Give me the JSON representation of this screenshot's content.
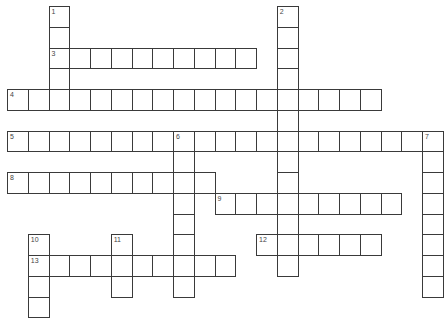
{
  "puzzle": {
    "type": "crossword",
    "grid": {
      "origin_x": 7,
      "origin_y": 6,
      "cell_size": 20.75,
      "columns": 21,
      "rows": 15
    },
    "entries": [
      {
        "number": "1",
        "direction": "down",
        "col": 2,
        "row": 0,
        "length": 5
      },
      {
        "number": "2",
        "direction": "down",
        "col": 13,
        "row": 0,
        "length": 13
      },
      {
        "number": "3",
        "direction": "across",
        "col": 2,
        "row": 2,
        "length": 10
      },
      {
        "number": "4",
        "direction": "across",
        "col": 0,
        "row": 4,
        "length": 18
      },
      {
        "number": "5",
        "direction": "across",
        "col": 0,
        "row": 6,
        "length": 21
      },
      {
        "number": "6",
        "direction": "down",
        "col": 8,
        "row": 6,
        "length": 8
      },
      {
        "number": "7",
        "direction": "down",
        "col": 20,
        "row": 6,
        "length": 8
      },
      {
        "number": "8",
        "direction": "across",
        "col": 0,
        "row": 8,
        "length": 10
      },
      {
        "number": "9",
        "direction": "across",
        "col": 10,
        "row": 9,
        "length": 9
      },
      {
        "number": "10",
        "direction": "down",
        "col": 1,
        "row": 11,
        "length": 4
      },
      {
        "number": "11",
        "direction": "down",
        "col": 5,
        "row": 11,
        "length": 3
      },
      {
        "number": "12",
        "direction": "across",
        "col": 12,
        "row": 11,
        "length": 6
      },
      {
        "number": "13",
        "direction": "across",
        "col": 1,
        "row": 12,
        "length": 10
      }
    ],
    "colors": {
      "background": "#ffffff",
      "grid_line": "#3a3a3a",
      "number_text": "#444444"
    }
  }
}
